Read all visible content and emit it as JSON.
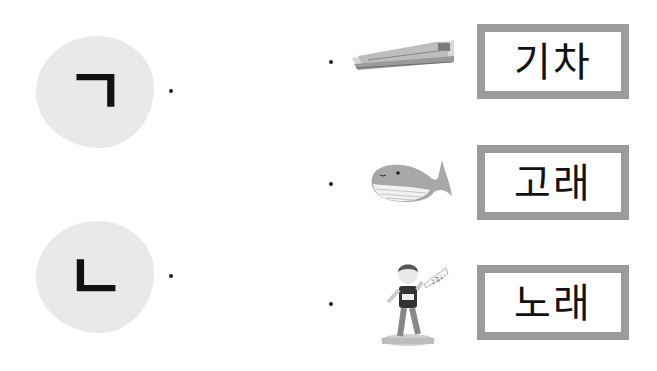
{
  "left_items": [
    {
      "consonant": "ㄱ",
      "label": "giyeok"
    },
    {
      "consonant": "ㄴ",
      "label": "nieun"
    }
  ],
  "right_items": [
    {
      "picture": "train-icon",
      "word": "기차"
    },
    {
      "picture": "whale-icon",
      "word": "고래"
    },
    {
      "picture": "singer-icon",
      "word": "노래"
    }
  ],
  "colors": {
    "blob": "#e9e9e9",
    "box_border": "#9b9b9b",
    "text": "#111111"
  }
}
